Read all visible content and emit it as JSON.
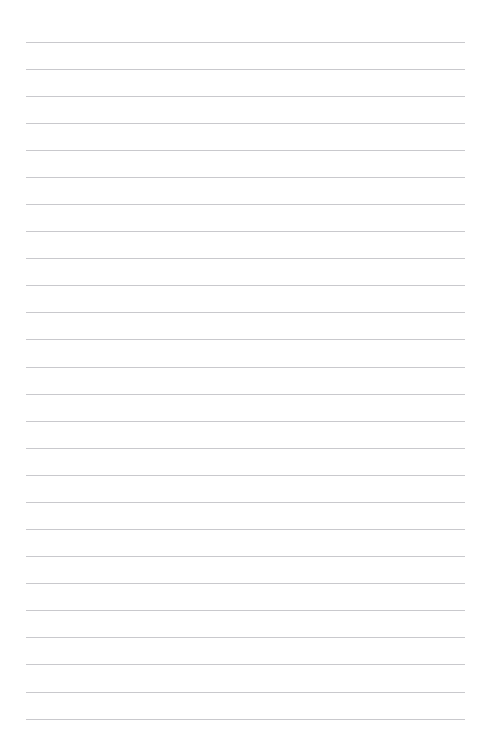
{
  "document": {
    "kind": "lined-paper-page",
    "title": "",
    "body_text": "",
    "background_color": "#ffffff"
  },
  "canvas": {
    "width": 489,
    "height": 750
  },
  "ruling": {
    "line_color": "#c9c9cd",
    "line_thickness_px": 1,
    "line_count": 26,
    "first_line_y": 41.5,
    "line_spacing_px": 27.08,
    "left_margin_x": 26,
    "right_margin_x": 465,
    "line_width_px": 439,
    "margin_rule": "none",
    "lines": [
      {
        "index": 1,
        "y": 41.5,
        "text": ""
      },
      {
        "index": 2,
        "y": 68.6,
        "text": ""
      },
      {
        "index": 3,
        "y": 95.7,
        "text": ""
      },
      {
        "index": 4,
        "y": 122.7,
        "text": ""
      },
      {
        "index": 5,
        "y": 149.8,
        "text": ""
      },
      {
        "index": 6,
        "y": 176.9,
        "text": ""
      },
      {
        "index": 7,
        "y": 204.0,
        "text": ""
      },
      {
        "index": 8,
        "y": 231.1,
        "text": ""
      },
      {
        "index": 9,
        "y": 258.2,
        "text": ""
      },
      {
        "index": 10,
        "y": 285.2,
        "text": ""
      },
      {
        "index": 11,
        "y": 312.3,
        "text": ""
      },
      {
        "index": 12,
        "y": 339.4,
        "text": ""
      },
      {
        "index": 13,
        "y": 366.5,
        "text": ""
      },
      {
        "index": 14,
        "y": 393.6,
        "text": ""
      },
      {
        "index": 15,
        "y": 420.7,
        "text": ""
      },
      {
        "index": 16,
        "y": 447.7,
        "text": ""
      },
      {
        "index": 17,
        "y": 474.8,
        "text": ""
      },
      {
        "index": 18,
        "y": 501.9,
        "text": ""
      },
      {
        "index": 19,
        "y": 529.0,
        "text": ""
      },
      {
        "index": 20,
        "y": 556.1,
        "text": ""
      },
      {
        "index": 21,
        "y": 583.2,
        "text": ""
      },
      {
        "index": 22,
        "y": 610.2,
        "text": ""
      },
      {
        "index": 23,
        "y": 637.3,
        "text": ""
      },
      {
        "index": 24,
        "y": 664.4,
        "text": ""
      },
      {
        "index": 25,
        "y": 691.5,
        "text": ""
      },
      {
        "index": 26,
        "y": 718.6,
        "text": ""
      }
    ]
  }
}
